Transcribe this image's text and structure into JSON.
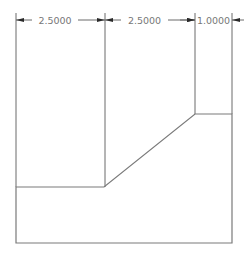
{
  "drawing": {
    "type": "2D profile with linear dimensions",
    "dimensions": [
      {
        "label": "2.5000",
        "from_x": 16,
        "to_x": 105
      },
      {
        "label": "2.5000",
        "from_x": 105,
        "to_x": 195
      },
      {
        "label": "1.0000",
        "from_x": 195,
        "to_x": 232
      }
    ],
    "colors": {
      "geometry": "#7a7a7a",
      "dimension": "#6a6a6a",
      "arrowhead": "#2a2a2a",
      "text": "#777777",
      "background": "#ffffff"
    }
  }
}
